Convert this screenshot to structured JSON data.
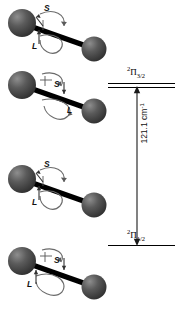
{
  "figure": {
    "type": "spin-orbit-coupling-diagram",
    "molecules": [
      {
        "id": "molecule-1",
        "spin_label": "S",
        "orbital_label": "L",
        "alignment": "parallel"
      },
      {
        "id": "molecule-2",
        "spin_label": "S",
        "orbital_label": "L",
        "alignment": "antiparallel"
      },
      {
        "id": "molecule-3",
        "spin_label": "S",
        "orbital_label": "L",
        "alignment": "parallel"
      },
      {
        "id": "molecule-4",
        "spin_label": "S",
        "orbital_label": "L",
        "alignment": "antiparallel"
      }
    ],
    "energy_levels": [
      {
        "id": "upper-level",
        "term_multiplicity": "2",
        "term_symbol": "Π",
        "term_j": "3/2"
      },
      {
        "id": "lower-level",
        "term_multiplicity": "2",
        "term_symbol": "Π",
        "term_j": "1/2"
      }
    ],
    "splitting": {
      "value": "121.1",
      "unit": "cm",
      "unit_exponent": "-1",
      "full_label": "121.1 cm⁻¹"
    },
    "colors": {
      "sphere_dark": "#3a3a3a",
      "sphere_mid": "#5e5e5e",
      "sphere_light": "#9a9a9a",
      "bond": "#000000",
      "arc": "#6a6a6a",
      "level_line": "#000000",
      "text": "#111111",
      "background": "#ffffff"
    }
  }
}
